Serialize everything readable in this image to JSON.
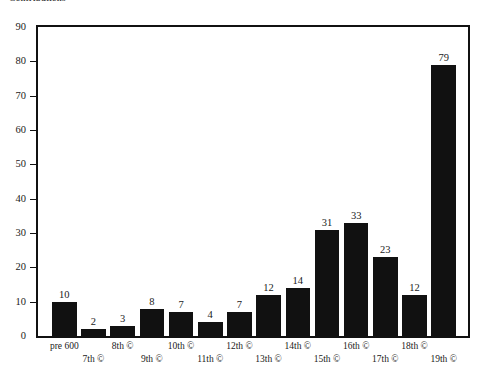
{
  "title": "Contributions",
  "chart_data": {
    "type": "bar",
    "title": "Contributions",
    "xlabel": "",
    "ylabel": "",
    "ylim": [
      0,
      90
    ],
    "ytick_step": 10,
    "yticks": [
      0,
      10,
      20,
      30,
      40,
      50,
      60,
      70,
      80,
      90
    ],
    "grid": false,
    "legend": null,
    "bar_color": "#111111",
    "background_color": "#ffffff",
    "value_labels_shown": true,
    "categories": [
      "pre 600",
      "7th ©",
      "8th ©",
      "9th ©",
      "10th ©",
      "11th ©",
      "12th ©",
      "13th ©",
      "14th ©",
      "15th ©",
      "16th ©",
      "17th ©",
      "18th ©",
      "19th ©"
    ],
    "values": [
      10,
      2,
      3,
      8,
      7,
      4,
      7,
      12,
      14,
      31,
      33,
      23,
      12,
      79
    ]
  }
}
